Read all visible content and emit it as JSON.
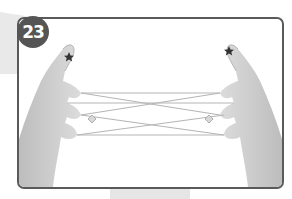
{
  "step": {
    "number": "23",
    "badge_color": "#555555",
    "frame_border_color": "#5a5a5a"
  },
  "illustration": {
    "subject": "two hands holding a string figure (cat's cradle)",
    "markers": [
      {
        "type": "star",
        "location": "left index fingertip"
      },
      {
        "type": "star",
        "location": "right index fingertip"
      },
      {
        "type": "diamond",
        "location": "string loop near left middle finger"
      },
      {
        "type": "diamond",
        "location": "string loop near right middle finger"
      }
    ],
    "hand_color": "#cfcfcf",
    "string_color": "#b8b8b8"
  }
}
